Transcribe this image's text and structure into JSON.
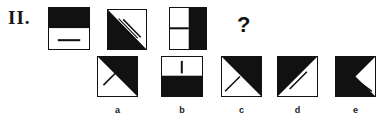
{
  "item": {
    "number_label": "II.",
    "question_mark": "?"
  },
  "stem": {
    "figures": [
      {
        "name": "stem-figure-1",
        "description": "square, top half black, bottom half white with short horizontal black line",
        "fill": "#111111",
        "x": 48,
        "y": 7,
        "w": 42,
        "h": 43
      },
      {
        "name": "stem-figure-2",
        "description": "square, lower-left triangle black, white diagonal stroke in upper-right white triangle",
        "fill": "#111111",
        "x": 107,
        "y": 9,
        "w": 40,
        "h": 41
      },
      {
        "name": "stem-figure-3",
        "description": "square, left half white with horizontal black line, right half black",
        "fill": "#111111",
        "x": 169,
        "y": 7,
        "w": 38,
        "h": 43
      }
    ]
  },
  "options": [
    {
      "key": "a",
      "label": "a",
      "description": "square, upper-right triangle black, black stroke parallel to diagonal in lower-left white triangle",
      "fill": "#111111",
      "x": 97,
      "y": 56,
      "w": 41,
      "h": 41,
      "label_x": 97,
      "label_w": 41,
      "label_y": 106
    },
    {
      "key": "b",
      "label": "b",
      "description": "square, top half white with short vertical black line, bottom half black",
      "fill": "#111111",
      "x": 161,
      "y": 56,
      "w": 42,
      "h": 41,
      "label_x": 161,
      "label_w": 42,
      "label_y": 106
    },
    {
      "key": "c",
      "label": "c",
      "description": "square, upper-right triangle black, short black stroke near lower-left corner",
      "fill": "#111111",
      "x": 221,
      "y": 56,
      "w": 41,
      "h": 41,
      "label_x": 221,
      "label_w": 41,
      "label_y": 106
    },
    {
      "key": "d",
      "label": "d",
      "description": "square, upper-left triangle black, black stroke parallel to diagonal in lower-right white triangle",
      "fill": "#111111",
      "x": 277,
      "y": 56,
      "w": 41,
      "h": 41,
      "label_x": 277,
      "label_w": 41,
      "label_y": 106
    },
    {
      "key": "e",
      "label": "e",
      "description": "square, left wedge black formed by both diagonals, black stroke in lower-right white region",
      "fill": "#111111",
      "x": 335,
      "y": 56,
      "w": 41,
      "h": 41,
      "label_x": 335,
      "label_w": 41,
      "label_y": 106
    }
  ],
  "question": {
    "x": 237,
    "y": 14
  }
}
